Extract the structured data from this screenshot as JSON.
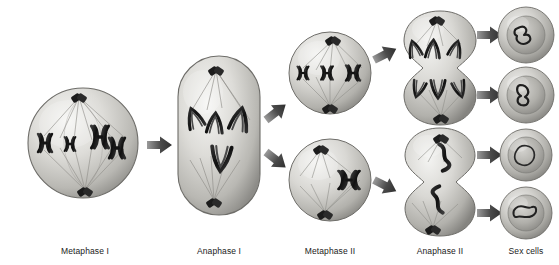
{
  "figure": {
    "background_color": "#ffffff",
    "palette": {
      "cell_light": "#f2f2f0",
      "cell_mid": "#c9c8c4",
      "cell_dark": "#8d8c88",
      "cell_outline": "#6e6d69",
      "chromosome_dark": "#1f1f1f",
      "chromosome_light": "#d8d7d3",
      "spindle_fiber": "#9a9994",
      "centriole": "#242424",
      "arrow_dark": "#3d3d3d",
      "arrow_light": "#8a8a8a",
      "label_color": "#1a1a1a"
    }
  },
  "stages": [
    {
      "id": "metaphase-1",
      "label": "Metaphase I",
      "label_x": 85,
      "label_y": 246,
      "cell_shape": "sphere",
      "cell_cx": 83,
      "cell_cy": 143,
      "cell_rx": 55,
      "cell_ry": 55,
      "chromosome_count": 4,
      "description": "Homologous chromosome pairs aligned at the metaphase plate with spindle fibers from both poles"
    },
    {
      "id": "anaphase-1",
      "label": "Anaphase I",
      "label_x": 219,
      "label_y": 246,
      "cell_shape": "elongated-oval",
      "cell_cx": 219,
      "cell_cy": 135,
      "cell_rx": 41,
      "cell_ry": 80,
      "chromosome_count": 4,
      "description": "Elongated cell with homologous chromosomes separating toward opposite poles"
    },
    {
      "id": "metaphase-2-top",
      "label": "Metaphase II",
      "label_x": 330,
      "label_y": 246,
      "cell_shape": "sphere",
      "cell_cx": 330,
      "cell_cy": 73,
      "cell_rx": 41,
      "cell_ry": 41,
      "chromosome_count": 3,
      "description": "Upper daughter cell with chromosomes aligned single-file at the equator"
    },
    {
      "id": "metaphase-2-bottom",
      "label": "",
      "cell_shape": "sphere",
      "cell_cx": 330,
      "cell_cy": 180,
      "cell_rx": 41,
      "cell_ry": 41,
      "chromosome_count": 1,
      "description": "Lower daughter cell with a single chromosome at the equator"
    },
    {
      "id": "anaphase-2-top",
      "label": "Anaphase  II",
      "label_x": 440,
      "label_y": 246,
      "cell_shape": "dumbbell",
      "cell_cx": 440,
      "cell_cy": 68,
      "cell_rx": 37,
      "cell_ry": 58,
      "chromosome_count": 6,
      "description": "Dividing cell with cleavage furrow, sister chromatids pulled to opposite poles"
    },
    {
      "id": "anaphase-2-bottom",
      "label": "",
      "cell_shape": "dumbbell",
      "cell_cx": 440,
      "cell_cy": 182,
      "cell_rx": 37,
      "cell_ry": 55,
      "chromosome_count": 2,
      "description": "Second dividing cell with cleavage furrow and separating chromatids"
    }
  ],
  "sex_cells": {
    "label": "Sex cells",
    "label_x": 526,
    "label_y": 246,
    "count": 4,
    "cells": [
      {
        "id": "sex-cell-1",
        "cx": 526,
        "cy": 35,
        "r": 28
      },
      {
        "id": "sex-cell-2",
        "cx": 526,
        "cy": 95,
        "r": 28
      },
      {
        "id": "sex-cell-3",
        "cx": 526,
        "cy": 155,
        "r": 26
      },
      {
        "id": "sex-cell-4",
        "cx": 526,
        "cy": 213,
        "r": 26
      }
    ],
    "description": "Four haploid sex cells, each containing a single chromosome"
  },
  "arrows": [
    {
      "id": "arrow-meta1-ana1",
      "x1": 146,
      "y1": 145,
      "x2": 174,
      "y2": 145,
      "angle": 0
    },
    {
      "id": "arrow-ana1-meta2-top",
      "x1": 266,
      "y1": 118,
      "x2": 292,
      "y2": 96,
      "angle": -38
    },
    {
      "id": "arrow-ana1-meta2-bottom",
      "x1": 266,
      "y1": 152,
      "x2": 292,
      "y2": 176,
      "angle": 38
    },
    {
      "id": "arrow-meta2-ana2-top",
      "x1": 375,
      "y1": 62,
      "x2": 400,
      "y2": 48,
      "angle": -27
    },
    {
      "id": "arrow-meta2-ana2-bottom",
      "x1": 375,
      "y1": 180,
      "x2": 400,
      "y2": 194,
      "angle": 27
    },
    {
      "id": "arrow-ana2-sex1",
      "x1": 476,
      "y1": 35,
      "x2": 498,
      "y2": 35,
      "angle": 0
    },
    {
      "id": "arrow-ana2-sex2",
      "x1": 476,
      "y1": 95,
      "x2": 498,
      "y2": 95,
      "angle": 0
    },
    {
      "id": "arrow-ana2-sex3",
      "x1": 476,
      "y1": 155,
      "x2": 498,
      "y2": 155,
      "angle": 0
    },
    {
      "id": "arrow-ana2-sex4",
      "x1": 476,
      "y1": 213,
      "x2": 498,
      "y2": 213,
      "angle": 0
    }
  ]
}
